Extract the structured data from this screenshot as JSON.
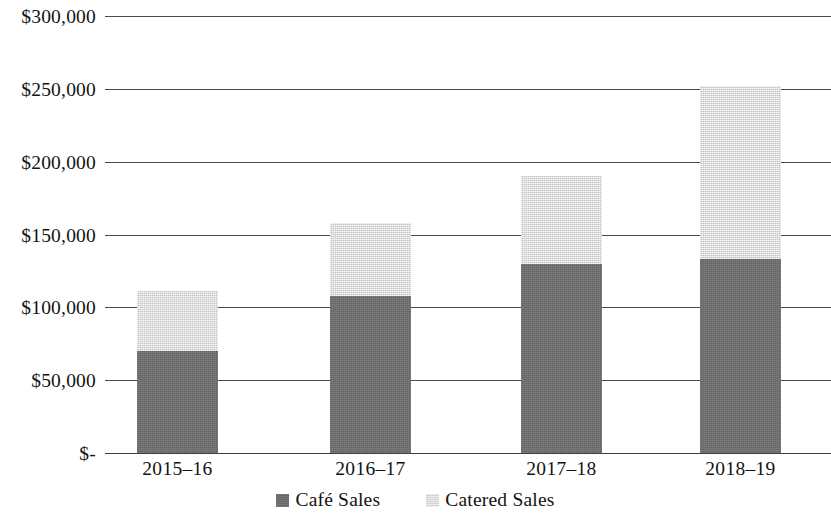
{
  "chart_data": {
    "type": "bar",
    "subtype": "stacked-column",
    "title": "",
    "subtitle": "",
    "xlabel": "",
    "ylabel": "",
    "categories": [
      "2015–16",
      "2016–17",
      "2017–18",
      "2018–19"
    ],
    "series": [
      {
        "name": "Café Sales",
        "color": "#6e6e6e",
        "values": [
          70000,
          108000,
          130000,
          133000
        ]
      },
      {
        "name": "Catered Sales",
        "color": "#d9d9d9",
        "values": [
          41000,
          50000,
          60000,
          119000
        ]
      }
    ],
    "totals": [
      111000,
      158000,
      190000,
      252000
    ],
    "ylim": [
      0,
      300000
    ],
    "ytick_values": [
      300000,
      250000,
      200000,
      150000,
      100000,
      50000,
      0
    ],
    "ytick_labels": [
      "$300,000",
      "$250,000",
      "$200,000",
      "$150,000",
      "$100,000",
      "$50,000",
      "$-"
    ],
    "grid": true,
    "grid_axis": "y",
    "legend_position": "bottom"
  },
  "axis": {
    "y_ticks": [
      {
        "label": "$300,000",
        "value": 300000
      },
      {
        "label": "$250,000",
        "value": 250000
      },
      {
        "label": "$200,000",
        "value": 200000
      },
      {
        "label": "$150,000",
        "value": 150000
      },
      {
        "label": "$100,000",
        "value": 100000
      },
      {
        "label": "$50,000",
        "value": 50000
      },
      {
        "label": "$-",
        "value": 0
      }
    ],
    "x_ticks": [
      {
        "label": "2015–16"
      },
      {
        "label": "2016–17"
      },
      {
        "label": "2017–18"
      },
      {
        "label": "2018–19"
      }
    ]
  },
  "legend": {
    "items": [
      {
        "label": "Café Sales",
        "color": "#6e6e6e"
      },
      {
        "label": "Catered Sales",
        "color": "#d9d9d9"
      }
    ]
  }
}
